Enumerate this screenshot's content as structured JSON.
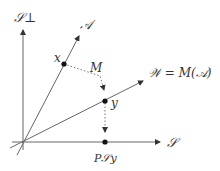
{
  "diagram": {
    "labels": {
      "s_perp": "𝒮⊥",
      "a_line": "𝒜",
      "x_point": "x",
      "m_map": "M",
      "w_line": "𝒲 = M(𝒜)",
      "y_point": "y",
      "s_axis": "𝒮",
      "projection": "P𝒮y"
    },
    "colors": {
      "line": "#555555",
      "point": "#111111",
      "text": "#333333"
    }
  }
}
